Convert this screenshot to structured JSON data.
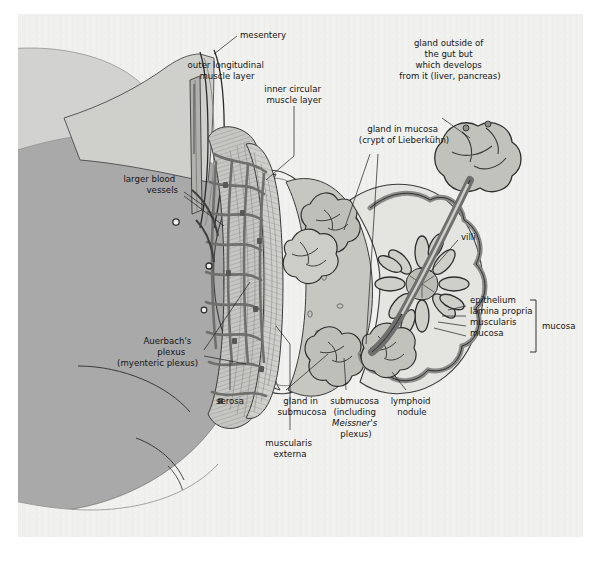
{
  "figure": {
    "background_color": "#f0f0ee",
    "page_color": "#ffffff",
    "ink_color": "#141414",
    "palette": {
      "body_gray": "#a9a9a9",
      "mesentery_gray": "#c9c9c7",
      "muscle_gray": "#bdbdbb",
      "plexus_mesh": "#8f8f8d",
      "mucosa_light": "#e2e2de",
      "submucosa_mid": "#c4c4c0",
      "gland_gray": "#b4b4b0",
      "lumen_light": "#eceae5"
    }
  },
  "labels": {
    "mesentery": "mesentery",
    "outer_longitudinal": "outer longitudinal\nmuscle layer",
    "outer_longitudinal_l1": "outer longitudinal",
    "outer_longitudinal_l2": "muscle layer",
    "inner_circular_l1": "inner circular",
    "inner_circular_l2": "muscle layer",
    "gland_outside_l1": "gland outside of",
    "gland_outside_l2": "the gut but",
    "gland_outside_l3": "which develops",
    "gland_outside_l4": "from it (liver, pancreas)",
    "gland_mucosa_l1": "gland in mucosa",
    "gland_mucosa_l2": "(crypt of Lieberkühn)",
    "larger_blood_l1": "larger blood",
    "larger_blood_l2": "vessels",
    "villi": "villi",
    "auerbach_l1": "Auerbach's",
    "auerbach_l2": "plexus",
    "auerbach_l3": "(myenteric plexus)",
    "serosa": "serosa",
    "gland_submucosa_l1": "gland in",
    "gland_submucosa_l2": "submucosa",
    "muscularis_externa_l1": "muscularis",
    "muscularis_externa_l2": "externa",
    "submucosa_l1": "submucosa",
    "submucosa_l2": "(including",
    "submucosa_l3": "Meissner's",
    "submucosa_l4": "plexus)",
    "lymphoid_l1": "lymphoid",
    "lymphoid_l2": "nodule",
    "epithelium": "epithelium",
    "lamina_propria": "lamina propria",
    "muscularis": "muscularis",
    "mucosa_sub": "mucosa",
    "mucosa_bracket": "mucosa"
  }
}
